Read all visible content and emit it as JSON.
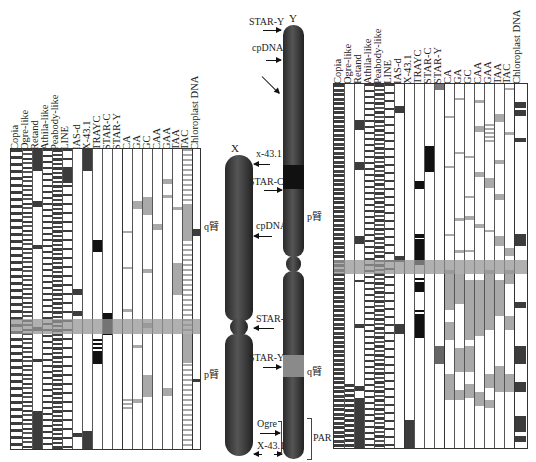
{
  "colors": {
    "dark_band": "#3c3c3c",
    "black_band": "#111111",
    "gray_band": "#a9a9a9",
    "highlight": "#999999",
    "chromosome": "#333333"
  },
  "left_table": {
    "headers": [
      "Copia",
      "Ogre-like",
      "Retand",
      "Athila-like",
      "Peabody-like",
      "LINE",
      "IAS-d",
      "X-43.1",
      "TRAYC",
      "STAR-C",
      "STAR-Y",
      "CA",
      "GA",
      "GC",
      "CAA",
      "GAA",
      "TAA",
      "TAC",
      "Chloroplast DNA"
    ],
    "side_labels": {
      "q_arm": "q臂",
      "p_arm": "p臂"
    }
  },
  "right_table": {
    "headers": [
      "Copia",
      "Ogre-like",
      "Retand",
      "Athila-like",
      "Peabody-like",
      "LINE",
      "IAS-d",
      "X-43.1",
      "TRAYC",
      "STAR-C",
      "STAR-Y",
      "CA",
      "GA",
      "GC",
      "CAA",
      "GAA",
      "TAA",
      "TAC",
      "Chloroplast DNA"
    ]
  },
  "x_chromosome": {
    "name": "X",
    "labels": {
      "x431": "x-43.1",
      "cpdna": "cpDNA",
      "starc": "STAR-C",
      "q_arm": "q臂",
      "p_arm": "p臂"
    }
  },
  "y_chromosome": {
    "name": "Y",
    "labels": {
      "stary_top": "STAR-Y",
      "cpdna": "cpDNA",
      "starc": "STAR-C",
      "p_arm": "p臂",
      "stary": "STAR-Y",
      "q_arm": "q臂",
      "ogre": "Ogre",
      "x431": "X-43.1",
      "par": "PAR"
    }
  }
}
